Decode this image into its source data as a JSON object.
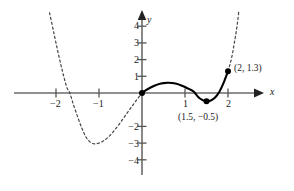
{
  "chart_data": {
    "type": "line",
    "title": "",
    "xlabel": "x",
    "ylabel": "y",
    "xlim": [
      -2.6,
      2.35
    ],
    "ylim": [
      -4.6,
      4.6
    ],
    "grid": false,
    "legend": null,
    "axis_color": "#555555",
    "curve_color": "#000000",
    "dash_color": "#444444",
    "x_ticks": [
      {
        "value": -2,
        "label": "−2"
      },
      {
        "value": -1,
        "label": "−1"
      },
      {
        "value": 1,
        "label": "1"
      },
      {
        "value": 2,
        "label": "2"
      }
    ],
    "y_ticks": [
      {
        "value": 4,
        "label": "4"
      },
      {
        "value": 3,
        "label": "3"
      },
      {
        "value": 2,
        "label": "2"
      },
      {
        "value": 1,
        "label": "1"
      },
      {
        "value": -2,
        "label": "−2"
      },
      {
        "value": -3,
        "label": "−3"
      },
      {
        "value": -4,
        "label": "−4"
      }
    ],
    "series": [
      {
        "name": "solid-segment",
        "style": "solid",
        "domain": [
          0,
          2
        ],
        "points": [
          [
            0.0,
            0.0
          ],
          [
            0.1,
            0.18
          ],
          [
            0.2,
            0.33
          ],
          [
            0.3,
            0.45
          ],
          [
            0.4,
            0.54
          ],
          [
            0.5,
            0.59
          ],
          [
            0.6,
            0.61
          ],
          [
            0.7,
            0.6
          ],
          [
            0.8,
            0.55
          ],
          [
            0.9,
            0.47
          ],
          [
            1.0,
            0.36
          ],
          [
            1.1,
            0.23
          ],
          [
            1.2,
            0.09
          ],
          [
            1.3,
            -0.22
          ],
          [
            1.4,
            -0.41
          ],
          [
            1.5,
            -0.5
          ],
          [
            1.6,
            -0.45
          ],
          [
            1.7,
            -0.27
          ],
          [
            1.8,
            0.08
          ],
          [
            1.9,
            0.62
          ],
          [
            2.0,
            1.3
          ]
        ]
      },
      {
        "name": "dashed-left-branch",
        "style": "dashed",
        "domain": [
          -2.15,
          0
        ],
        "points": [
          [
            -2.15,
            4.8
          ],
          [
            -2.05,
            3.6
          ],
          [
            -1.95,
            2.4
          ],
          [
            -1.85,
            1.3
          ],
          [
            -1.75,
            0.35
          ],
          [
            -1.68,
            0.0
          ],
          [
            -1.6,
            -0.65
          ],
          [
            -1.5,
            -1.4
          ],
          [
            -1.4,
            -2.1
          ],
          [
            -1.3,
            -2.65
          ],
          [
            -1.2,
            -2.95
          ],
          [
            -1.1,
            -3.05
          ],
          [
            -1.0,
            -3.0
          ],
          [
            -0.9,
            -2.88
          ],
          [
            -0.8,
            -2.68
          ],
          [
            -0.7,
            -2.42
          ],
          [
            -0.6,
            -2.1
          ],
          [
            -0.5,
            -1.76
          ],
          [
            -0.4,
            -1.4
          ],
          [
            -0.3,
            -1.03
          ],
          [
            -0.2,
            -0.68
          ],
          [
            -0.1,
            -0.33
          ],
          [
            0.0,
            0.0
          ]
        ]
      },
      {
        "name": "dashed-right-branch",
        "style": "dashed",
        "domain": [
          2,
          2.25
        ],
        "points": [
          [
            2.0,
            1.3
          ],
          [
            2.05,
            1.75
          ],
          [
            2.1,
            2.3
          ],
          [
            2.14,
            2.9
          ],
          [
            2.18,
            3.5
          ],
          [
            2.22,
            4.2
          ],
          [
            2.25,
            4.85
          ]
        ]
      }
    ],
    "markers": [
      {
        "name": "origin-point",
        "x": 0,
        "y": 0,
        "label": ""
      },
      {
        "name": "minimum-point",
        "x": 1.5,
        "y": -0.5,
        "label": "(1.5, −0.5)"
      },
      {
        "name": "endpoint",
        "x": 2,
        "y": 1.3,
        "label": "(2, 1.3)"
      }
    ],
    "annotations": [
      {
        "name": "endpoint-label",
        "text": "(2, 1.3)"
      },
      {
        "name": "minimum-label",
        "text": "(1.5, −0.5)"
      }
    ]
  },
  "axes": {
    "x_axis_label": "x",
    "y_axis_label": "y"
  }
}
